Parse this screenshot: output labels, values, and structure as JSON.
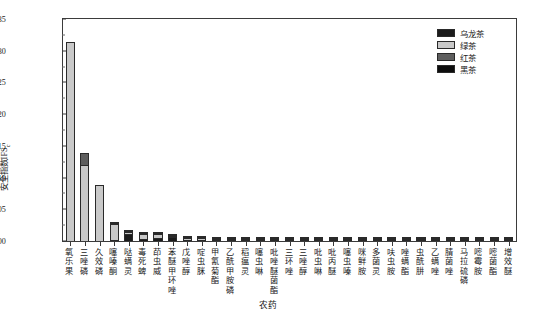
{
  "chart_data": {
    "type": "bar",
    "subtype": "stacked-vertical",
    "title": "",
    "xlabel": "农药",
    "ylabel": "安全指数IFS",
    "ylabel_sub": "c",
    "ylim": [
      0.0,
      0.0035
    ],
    "ytick_step": 0.0005,
    "yticks": [
      "0.0000",
      "0.0005",
      "0.0010",
      "0.0015",
      "0.0020",
      "0.0025",
      "0.0030",
      "0.0035"
    ],
    "ytick_values": [
      0.0,
      0.0005,
      0.001,
      0.0015,
      0.002,
      0.0025,
      0.003,
      0.0035
    ],
    "minor_ticks": true,
    "grid": false,
    "legend_position": "top-right",
    "categories": [
      "氧乐果",
      "三唑磷",
      "久效磷",
      "噻嗪酮",
      "哒螨灵",
      "毒死蜱",
      "茚虫威",
      "苯醚甲环唑",
      "戊唑醇",
      "啶虫脒",
      "甲氰菊酯",
      "乙酰甲胺磷",
      "稻瘟灵",
      "噻虫啉",
      "吡唑醚菌酯",
      "三环唑",
      "三唑醇",
      "吡虫啉",
      "吡丙醚",
      "噻虫嗪",
      "咪鲜胺",
      "多菌灵",
      "呋虫胺",
      "唑螨酯",
      "虫酰肼",
      "乙螨唑",
      "腈菌唑",
      "马拉硫磷",
      "嘧霉胺",
      "嘧菌酯",
      "增效醚"
    ],
    "series": [
      {
        "name": "乌龙茶",
        "color": "#1b1b1b",
        "values": [
          0.0,
          0.0,
          0.0,
          1e-05,
          0.000105,
          2.5e-05,
          5.5e-05,
          6.2e-05,
          2.2e-05,
          1.8e-05,
          1.2e-05,
          1e-05,
          9e-06,
          8e-06,
          7e-06,
          7e-06,
          6e-06,
          6e-06,
          5e-06,
          5e-06,
          4e-06,
          4e-06,
          4e-06,
          3e-06,
          3e-06,
          3e-06,
          2e-06,
          2e-06,
          2e-06,
          2e-06,
          1e-06
        ]
      },
      {
        "name": "绿茶",
        "color": "#c9c9c9",
        "values": [
          0.003135,
          0.001195,
          0.000885,
          0.00025,
          4e-05,
          8.5e-05,
          5e-05,
          1.2e-05,
          3e-05,
          2.2e-05,
          2.2e-05,
          1.6e-05,
          1.3e-05,
          1.2e-05,
          1.1e-05,
          1e-05,
          9e-06,
          8e-06,
          8e-06,
          7e-06,
          7e-06,
          6e-06,
          6e-06,
          5e-06,
          5e-06,
          4e-06,
          4e-06,
          4e-06,
          3e-06,
          3e-06,
          3e-06
        ]
      },
      {
        "name": "红茶",
        "color": "#5e5e5e",
        "values": [
          0.0,
          0.000185,
          0.0,
          2e-05,
          2e-05,
          1.2e-05,
          1e-05,
          8e-06,
          8e-06,
          8e-06,
          7e-06,
          6e-06,
          6e-06,
          5e-06,
          5e-06,
          5e-06,
          4e-06,
          4e-06,
          4e-06,
          3e-06,
          3e-06,
          3e-06,
          3e-06,
          2e-06,
          2e-06,
          2e-06,
          2e-06,
          2e-06,
          1e-06,
          1e-06,
          1e-06
        ]
      },
      {
        "name": "黑茶",
        "color": "#0d0d0d",
        "values": [
          0.0,
          0.0,
          0.0,
          5e-06,
          5e-06,
          4e-06,
          4e-06,
          4e-06,
          4e-06,
          3e-06,
          3e-06,
          3e-06,
          3e-06,
          3e-06,
          2e-06,
          2e-06,
          2e-06,
          2e-06,
          2e-06,
          2e-06,
          2e-06,
          1e-06,
          1e-06,
          1e-06,
          1e-06,
          1e-06,
          1e-06,
          1e-06,
          1e-06,
          1e-06,
          1e-06
        ]
      }
    ]
  },
  "legend": {
    "items": [
      {
        "label": "乌龙茶",
        "color": "#1b1b1b"
      },
      {
        "label": "绿茶",
        "color": "#c9c9c9"
      },
      {
        "label": "红茶",
        "color": "#5e5e5e"
      },
      {
        "label": "黑茶",
        "color": "#0d0d0d"
      }
    ]
  }
}
